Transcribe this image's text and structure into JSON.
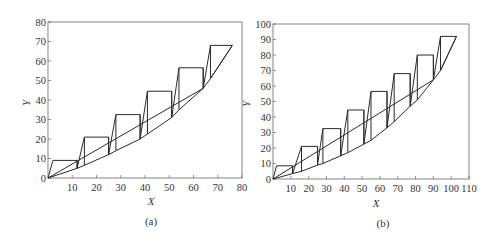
{
  "chart_data": [
    {
      "type": "line",
      "panel": "(a)",
      "title": "",
      "xlabel": "X",
      "ylabel": "Y",
      "xlim": [
        0,
        80
      ],
      "ylim": [
        0,
        80
      ],
      "xticks": [
        10,
        20,
        30,
        40,
        50,
        60,
        70,
        80
      ],
      "yticks": [
        0,
        10,
        20,
        30,
        40,
        50,
        60,
        70,
        80
      ],
      "grid": false,
      "legend": null,
      "series": [
        {
          "name": "operating-line",
          "x": [
            0,
            64
          ],
          "y": [
            0,
            46
          ]
        },
        {
          "name": "equilibrium-curve",
          "x": [
            0,
            12,
            15,
            25,
            28,
            38,
            41,
            51,
            54,
            64,
            67,
            76
          ],
          "y": [
            0,
            5,
            6.5,
            12,
            14,
            20,
            22.5,
            31,
            35,
            46,
            51,
            68
          ]
        },
        {
          "name": "stages",
          "x": [
            0,
            2,
            12,
            12,
            15,
            25,
            25,
            28,
            38,
            38,
            41,
            51,
            51,
            54,
            64,
            64,
            67,
            76
          ],
          "y": [
            0,
            9,
            9,
            5,
            21,
            21,
            12,
            32.5,
            32.5,
            20,
            44.5,
            44.5,
            31,
            56.5,
            56.5,
            46,
            68,
            68
          ]
        }
      ],
      "stage_verticals": [
        [
          12,
          5,
          9
        ],
        [
          15,
          6.5,
          21
        ],
        [
          25,
          12,
          21
        ],
        [
          28,
          14,
          32.5
        ],
        [
          38,
          20,
          32.5
        ],
        [
          41,
          22.5,
          44.5
        ],
        [
          51,
          31,
          44.5
        ],
        [
          54,
          35,
          56.5
        ],
        [
          64,
          46,
          56.5
        ],
        [
          67,
          51,
          68
        ]
      ],
      "caption": "(a)"
    },
    {
      "type": "line",
      "panel": "(b)",
      "title": "",
      "xlabel": "X",
      "ylabel": "Y",
      "xlim": [
        0,
        110
      ],
      "ylim": [
        0,
        100
      ],
      "xticks": [
        10,
        20,
        30,
        40,
        50,
        60,
        70,
        80,
        90,
        100,
        110
      ],
      "yticks": [
        0,
        10,
        20,
        30,
        40,
        50,
        60,
        70,
        80,
        90,
        100
      ],
      "grid": false,
      "legend": null,
      "series": [
        {
          "name": "operating-line",
          "x": [
            0,
            90
          ],
          "y": [
            0,
            64
          ]
        },
        {
          "name": "equilibrium-curve",
          "x": [
            0,
            11,
            16,
            25,
            28,
            38,
            42,
            51,
            55,
            64,
            68,
            77,
            81,
            90,
            94,
            103
          ],
          "y": [
            0,
            3.5,
            5,
            9,
            10,
            15,
            17,
            22.5,
            25,
            33,
            37,
            47,
            51,
            64,
            70,
            92
          ]
        },
        {
          "name": "stages",
          "x": [
            0,
            2,
            11,
            11,
            16,
            25,
            25,
            28,
            38,
            38,
            42,
            51,
            51,
            55,
            64,
            64,
            68,
            77,
            77,
            81,
            90,
            90,
            94,
            103
          ],
          "y": [
            0,
            8.5,
            8.5,
            3.5,
            21,
            21,
            9,
            32.5,
            32.5,
            15,
            44.5,
            44.5,
            22.5,
            56.5,
            56.5,
            33,
            68,
            68,
            47,
            80,
            80,
            64,
            92,
            92
          ]
        }
      ],
      "stage_verticals": [
        [
          11,
          3.5,
          8.5
        ],
        [
          16,
          5,
          21
        ],
        [
          25,
          9,
          21
        ],
        [
          28,
          10,
          32.5
        ],
        [
          38,
          15,
          32.5
        ],
        [
          42,
          17,
          44.5
        ],
        [
          51,
          22.5,
          44.5
        ],
        [
          55,
          25,
          56.5
        ],
        [
          64,
          33,
          56.5
        ],
        [
          68,
          37,
          68
        ],
        [
          77,
          47,
          68
        ],
        [
          81,
          51,
          80
        ],
        [
          90,
          64,
          80
        ],
        [
          94,
          70,
          92
        ]
      ],
      "caption": "(b)"
    }
  ],
  "labels": {
    "a": {
      "xlabel": "X",
      "ylabel": "Y",
      "caption": "(a)",
      "xticks": [
        "10",
        "20",
        "30",
        "40",
        "50",
        "60",
        "70",
        "80"
      ],
      "yticks": [
        "0",
        "10",
        "20",
        "30",
        "40",
        "50",
        "60",
        "70",
        "80"
      ]
    },
    "b": {
      "xlabel": "X",
      "ylabel": "Y",
      "caption": "(b)",
      "xticks": [
        "10",
        "20",
        "30",
        "40",
        "50",
        "60",
        "70",
        "80",
        "90",
        "100",
        "110"
      ],
      "yticks": [
        "0",
        "10",
        "20",
        "30",
        "40",
        "50",
        "60",
        "70",
        "80",
        "90",
        "100"
      ]
    }
  },
  "colors": {
    "line": "#2a2a2a",
    "frame": "#555555",
    "text": "#333333"
  }
}
